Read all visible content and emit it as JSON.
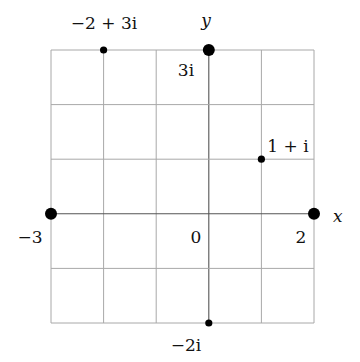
{
  "diagram": {
    "type": "complex-plane",
    "grid": {
      "x_min": -3,
      "x_max": 2,
      "y_min": -2,
      "y_max": 3,
      "step": 1,
      "line_color": "#a8a8a8"
    },
    "axes": {
      "x_label": "x",
      "y_label": "y",
      "origin_label": "0"
    },
    "points": [
      {
        "re": -2,
        "im": 3,
        "label": "−2 + 3i",
        "size": "small"
      },
      {
        "re": 0,
        "im": 3,
        "label": "3i",
        "size": "large"
      },
      {
        "re": 1,
        "im": 1,
        "label": "1 + i",
        "size": "small"
      },
      {
        "re": -3,
        "im": 0,
        "label": "−3",
        "size": "large"
      },
      {
        "re": 2,
        "im": 0,
        "label": "2",
        "size": "large"
      },
      {
        "re": 0,
        "im": -2,
        "label": "−2i",
        "size": "small"
      }
    ],
    "point_color": "#000000"
  }
}
